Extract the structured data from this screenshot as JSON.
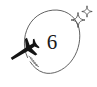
{
  "illustration": {
    "title": "airplane circling number six",
    "background_color": "#ffffff",
    "stroke_color": "#5a5a5a",
    "ink_color": "#141414",
    "center_number": "6",
    "circle": {
      "shape": "open-hand-drawn-circle",
      "center_x": 50,
      "center_y": 43,
      "radius_x": 28,
      "radius_y": 34,
      "gap_side": "lower-left",
      "stroke_width": 0.9
    },
    "airplane": {
      "glyph": "airplane",
      "heading": "upper-left",
      "x": 10,
      "y": 41,
      "width": 26,
      "height": 22
    },
    "motion_dashes": {
      "name": "speed-lines",
      "count": 5,
      "x": 28,
      "y": 56
    },
    "sparkles": [
      {
        "name": "sparkle-large",
        "cx": 78,
        "cy": 20,
        "size": 7
      },
      {
        "name": "sparkle-small",
        "cx": 87,
        "cy": 11,
        "size": 5
      }
    ]
  }
}
